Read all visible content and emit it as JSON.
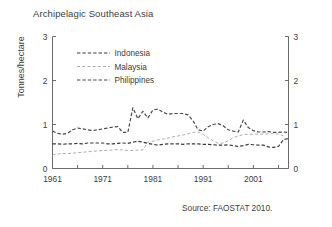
{
  "chart_data": {
    "type": "line",
    "title": "Archipelagic Southeast Asia",
    "xlabel": "",
    "ylabel": "Tonnes/hectare",
    "ylim": [
      0,
      3
    ],
    "yticks": [
      "0",
      "1",
      "2",
      "3"
    ],
    "xlim": [
      1961,
      2008
    ],
    "xticks": [
      "1961",
      "1971",
      "1981",
      "1991",
      "2001"
    ],
    "xtick_values": [
      1961,
      1971,
      1981,
      1991,
      2001
    ],
    "xminor_step": 5,
    "grid": false,
    "legend_position": "upper-left-inside",
    "right_axis_mirrored": true,
    "source": "Source: FAOSTAT 2010.",
    "x": [
      1961,
      1962,
      1963,
      1964,
      1965,
      1966,
      1967,
      1968,
      1969,
      1970,
      1971,
      1972,
      1973,
      1974,
      1975,
      1976,
      1977,
      1978,
      1979,
      1980,
      1981,
      1982,
      1983,
      1984,
      1985,
      1986,
      1987,
      1988,
      1989,
      1990,
      1991,
      1992,
      1993,
      1994,
      1995,
      1996,
      1997,
      1998,
      1999,
      2000,
      2001,
      2002,
      2003,
      2004,
      2005,
      2006,
      2007,
      2008
    ],
    "series": [
      {
        "name": "Indonesia",
        "color": "#3a3a3a",
        "style": "dashed",
        "values": [
          0.56,
          0.56,
          0.55,
          0.56,
          0.56,
          0.57,
          0.56,
          0.58,
          0.58,
          0.58,
          0.58,
          0.56,
          0.56,
          0.57,
          0.58,
          0.57,
          0.6,
          0.62,
          0.6,
          0.57,
          0.55,
          0.53,
          0.55,
          0.56,
          0.56,
          0.56,
          0.55,
          0.56,
          0.56,
          0.56,
          0.55,
          0.55,
          0.54,
          0.53,
          0.53,
          0.54,
          0.52,
          0.5,
          0.52,
          0.55,
          0.54,
          0.53,
          0.53,
          0.49,
          0.48,
          0.5,
          0.66,
          0.68
        ]
      },
      {
        "name": "Malaysia",
        "color": "#a8a8a8",
        "style": "dashed",
        "values": [
          0.31,
          0.33,
          0.34,
          0.34,
          0.35,
          0.36,
          0.37,
          0.38,
          0.39,
          0.4,
          0.41,
          0.41,
          0.42,
          0.43,
          0.42,
          0.41,
          0.41,
          0.42,
          0.42,
          0.6,
          0.62,
          0.65,
          0.67,
          0.69,
          0.72,
          0.74,
          0.76,
          0.79,
          0.82,
          0.83,
          0.78,
          0.7,
          0.63,
          0.57,
          0.58,
          0.63,
          0.7,
          0.74,
          0.77,
          0.78,
          0.78,
          0.78,
          0.78,
          0.79,
          0.79,
          0.78,
          0.74,
          0.62
        ]
      },
      {
        "name": "Philippines",
        "color": "#4a4a4a",
        "style": "dashed",
        "values": [
          0.85,
          0.8,
          0.78,
          0.8,
          0.88,
          0.92,
          0.9,
          0.88,
          0.86,
          0.88,
          0.9,
          0.92,
          0.94,
          0.95,
          0.82,
          0.82,
          1.38,
          1.13,
          1.3,
          1.15,
          1.33,
          1.35,
          1.28,
          1.23,
          1.25,
          1.25,
          1.25,
          1.22,
          1.08,
          0.88,
          0.85,
          0.95,
          1.0,
          1.02,
          0.97,
          0.88,
          0.85,
          0.83,
          1.1,
          0.93,
          0.86,
          0.83,
          0.83,
          0.84,
          0.82,
          0.82,
          0.83,
          0.82
        ]
      }
    ]
  },
  "legend": {
    "items": [
      {
        "label": "Indonesia"
      },
      {
        "label": "Malaysia"
      },
      {
        "label": "Philippines"
      }
    ]
  }
}
